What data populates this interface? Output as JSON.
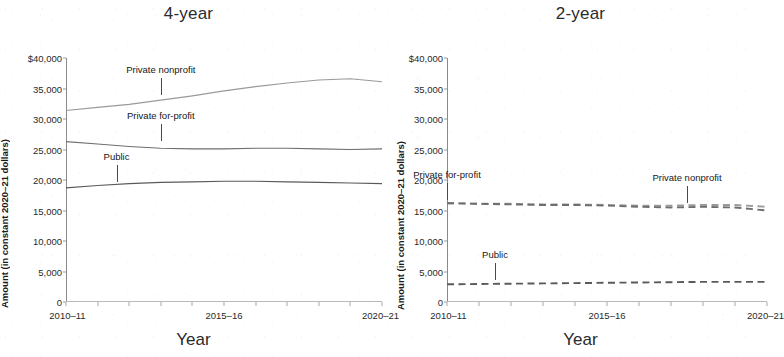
{
  "figure": {
    "panels": [
      {
        "id": "four-year",
        "title": "4-year",
        "xlabel": "Year",
        "ylabel": "Amount (in constant 2020–21 dollars)"
      },
      {
        "id": "two-year",
        "title": "2-year",
        "xlabel": "Year",
        "ylabel": "Amount (in constant 2020–21 dollars)"
      }
    ]
  },
  "axis": {
    "y_tick_labels": [
      "$40,000",
      "35,000",
      "30,000",
      "25,000",
      "20,000",
      "15,000",
      "10,000",
      "5,000",
      "0"
    ],
    "y_tick_values": [
      40000,
      35000,
      30000,
      25000,
      20000,
      15000,
      10000,
      5000,
      0
    ],
    "x_tick_labels": [
      "2010–11",
      "2015–16",
      "2020–21"
    ],
    "x_all_ticks": [
      "2010–11",
      "2011–12",
      "2012–13",
      "2013–14",
      "2014–15",
      "2015–16",
      "2016–17",
      "2017–18",
      "2018–19",
      "2019–20",
      "2020–21"
    ]
  },
  "colors": {
    "public": "#5a5a5a",
    "private_nonprofit": "#9a9a9a",
    "private_forprofit": "#6e6e6e",
    "axis": "#8a8a8a",
    "text": "#1a1a1a"
  },
  "annotations": {
    "four_year": [
      {
        "label": "Private nonprofit",
        "x": 2013,
        "y": 33400
      },
      {
        "label": "Private for-profit",
        "x": 2013,
        "y": 25900
      },
      {
        "label": "Public",
        "x": 2011.6,
        "y": 19200
      }
    ],
    "two_year": [
      {
        "label": "Private for-profit",
        "x": 2010,
        "y": 16200
      },
      {
        "label": "Private nonprofit",
        "x": 2017.5,
        "y": 15700
      },
      {
        "label": "Public",
        "x": 2011.5,
        "y": 3100
      }
    ]
  },
  "chart_data": [
    {
      "type": "line",
      "title": "4-year",
      "xlabel": "Year",
      "ylabel": "Amount (in constant 2020–21 dollars)",
      "categories": [
        "2010–11",
        "2011–12",
        "2012–13",
        "2013–14",
        "2014–15",
        "2015–16",
        "2016–17",
        "2017–18",
        "2018–19",
        "2019–20",
        "2020–21"
      ],
      "ylim": [
        0,
        40000
      ],
      "ytick_step": 5000,
      "grid": false,
      "legend": "inline-annotations",
      "series": [
        {
          "name": "Private nonprofit",
          "style": "solid",
          "color": "#9a9a9a",
          "values": [
            31400,
            31900,
            32400,
            33100,
            33800,
            34600,
            35300,
            35900,
            36400,
            36600,
            36100
          ]
        },
        {
          "name": "Private for-profit",
          "style": "solid",
          "color": "#6e6e6e",
          "values": [
            26300,
            25900,
            25500,
            25200,
            25100,
            25100,
            25200,
            25200,
            25100,
            25000,
            25100
          ]
        },
        {
          "name": "Public",
          "style": "solid",
          "color": "#5a5a5a",
          "values": [
            18700,
            19100,
            19400,
            19600,
            19700,
            19800,
            19800,
            19700,
            19600,
            19500,
            19400
          ]
        }
      ]
    },
    {
      "type": "line",
      "title": "2-year",
      "xlabel": "Year",
      "ylabel": "Amount (in constant 2020–21 dollars)",
      "categories": [
        "2010–11",
        "2011–12",
        "2012–13",
        "2013–14",
        "2014–15",
        "2015–16",
        "2016–17",
        "2017–18",
        "2018–19",
        "2019–20",
        "2020–21"
      ],
      "ylim": [
        0,
        40000
      ],
      "ytick_step": 5000,
      "grid": false,
      "legend": "inline-annotations",
      "series": [
        {
          "name": "Private nonprofit",
          "style": "dashed",
          "color": "#9a9a9a",
          "values": [
            16200,
            16100,
            16100,
            16000,
            16000,
            15900,
            15800,
            15800,
            15900,
            15900,
            15600
          ]
        },
        {
          "name": "Private for-profit",
          "style": "dashed",
          "color": "#6e6e6e",
          "values": [
            16200,
            16100,
            16000,
            15900,
            15900,
            15800,
            15600,
            15500,
            15600,
            15500,
            15000
          ]
        },
        {
          "name": "Public",
          "style": "dashed",
          "color": "#5a5a5a",
          "values": [
            2900,
            2950,
            3000,
            3050,
            3100,
            3150,
            3200,
            3250,
            3300,
            3300,
            3300
          ]
        }
      ]
    }
  ]
}
